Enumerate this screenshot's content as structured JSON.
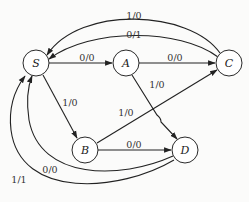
{
  "diagram": {
    "type": "state-transition-diagram",
    "background": "#fbfbfa",
    "stroke_color": "#222222",
    "nodes": [
      {
        "id": "S",
        "label": "S",
        "x": 36,
        "y": 63,
        "r": 13
      },
      {
        "id": "A",
        "label": "A",
        "x": 126,
        "y": 63,
        "r": 13
      },
      {
        "id": "C",
        "label": "C",
        "x": 229,
        "y": 63,
        "r": 13
      },
      {
        "id": "B",
        "label": "B",
        "x": 85,
        "y": 150,
        "r": 13
      },
      {
        "id": "D",
        "label": "D",
        "x": 185,
        "y": 150,
        "r": 13
      }
    ],
    "edges": [
      {
        "id": "C-S-1",
        "from": "C",
        "to": "S",
        "label": "1/0"
      },
      {
        "id": "C-S-2",
        "from": "C",
        "to": "S",
        "label": "0/1"
      },
      {
        "id": "S-A",
        "from": "S",
        "to": "A",
        "label": "0/0"
      },
      {
        "id": "A-C",
        "from": "A",
        "to": "C",
        "label": "0/0"
      },
      {
        "id": "S-B",
        "from": "S",
        "to": "B",
        "label": "1/0"
      },
      {
        "id": "A-D",
        "from": "A",
        "to": "D",
        "label": "1/0"
      },
      {
        "id": "B-C",
        "from": "B",
        "to": "C",
        "label": "1/0"
      },
      {
        "id": "B-D",
        "from": "B",
        "to": "D",
        "label": "0/0"
      },
      {
        "id": "D-S-1",
        "from": "D",
        "to": "S",
        "label": "0/0"
      },
      {
        "id": "D-S-2",
        "from": "D",
        "to": "S",
        "label": "1/1"
      }
    ]
  }
}
